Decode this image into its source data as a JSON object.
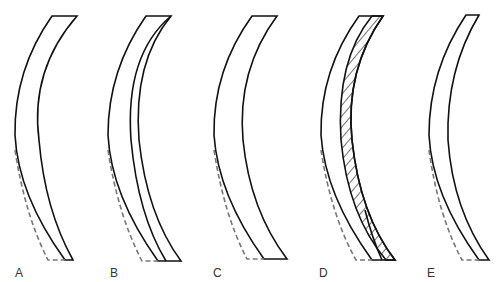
{
  "figure": {
    "panels": [
      {
        "id": "A",
        "label": "A"
      },
      {
        "id": "B",
        "label": "B"
      },
      {
        "id": "C",
        "label": "C"
      },
      {
        "id": "D",
        "label": "D"
      },
      {
        "id": "E",
        "label": "E"
      }
    ],
    "colors": {
      "stroke": "#111111",
      "dashed": "#777777",
      "background": "#ffffff"
    }
  }
}
